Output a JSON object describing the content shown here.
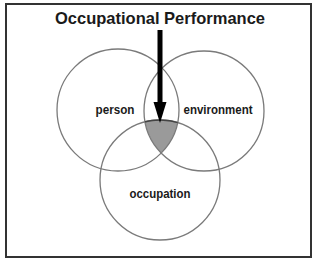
{
  "diagram": {
    "title": "Occupational Performance",
    "circles": [
      {
        "label": "person",
        "cx": 118,
        "cy": 110,
        "r": 61
      },
      {
        "label": "environment",
        "cx": 204,
        "cy": 111,
        "r": 60
      },
      {
        "label": "occupation",
        "cx": 160,
        "cy": 180,
        "r": 60
      }
    ],
    "intersection_fill": "#999999",
    "arrow": {
      "points_to": "intersection",
      "color": "#000000"
    }
  }
}
